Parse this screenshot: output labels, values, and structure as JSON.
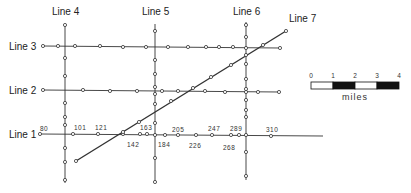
{
  "diagram": {
    "colors": {
      "line": "#333333",
      "point_fill": "#ffffff",
      "point_stroke": "#333333",
      "text": "#222222"
    },
    "lines": [
      {
        "id": "line-1",
        "label": "Line 1",
        "label_pos": [
          9,
          138
        ],
        "from": [
          40,
          134
        ],
        "to": [
          323,
          136
        ],
        "points": [
          [
            40,
            134
          ],
          [
            73,
            134
          ],
          [
            98,
            134
          ],
          [
            123,
            134
          ],
          [
            140,
            134
          ],
          [
            147,
            134
          ],
          [
            155,
            135
          ],
          [
            165,
            135
          ],
          [
            178,
            135
          ],
          [
            196,
            135
          ],
          [
            212,
            135
          ],
          [
            231,
            135
          ],
          [
            239,
            135
          ],
          [
            246,
            135
          ],
          [
            271,
            136
          ]
        ]
      },
      {
        "id": "line-2",
        "label": "Line 2",
        "label_pos": [
          9,
          94
        ],
        "from": [
          43,
          90
        ],
        "to": [
          280,
          92
        ],
        "points": [
          [
            43,
            90
          ],
          [
            83,
            90
          ],
          [
            110,
            91
          ],
          [
            137,
            91
          ],
          [
            162,
            91
          ],
          [
            178,
            91
          ],
          [
            205,
            91
          ],
          [
            225,
            92
          ],
          [
            246,
            92
          ],
          [
            258,
            92
          ],
          [
            279,
            92
          ]
        ]
      },
      {
        "id": "line-3",
        "label": "Line 3",
        "label_pos": [
          9,
          50
        ],
        "from": [
          43,
          46
        ],
        "to": [
          280,
          48
        ],
        "points": [
          [
            43,
            46
          ],
          [
            58,
            46
          ],
          [
            75,
            46
          ],
          [
            100,
            46
          ],
          [
            123,
            47
          ],
          [
            146,
            47
          ],
          [
            168,
            47
          ],
          [
            188,
            47
          ],
          [
            206,
            47
          ],
          [
            219,
            47
          ],
          [
            233,
            47
          ],
          [
            246,
            48
          ],
          [
            280,
            48
          ]
        ]
      },
      {
        "id": "line-4",
        "label": "Line 4",
        "label_pos": [
          52,
          15
        ],
        "from": [
          65,
          25
        ],
        "to": [
          65,
          183
        ],
        "points": [
          [
            65,
            25
          ],
          [
            65,
            58
          ],
          [
            65,
            76
          ],
          [
            65,
            103
          ],
          [
            65,
            117
          ],
          [
            65,
            125
          ],
          [
            65,
            148
          ],
          [
            65,
            162
          ],
          [
            65,
            180
          ]
        ]
      },
      {
        "id": "line-5",
        "label": "Line 5",
        "label_pos": [
          142,
          15
        ],
        "from": [
          155,
          24
        ],
        "to": [
          155,
          183
        ],
        "points": [
          [
            155,
            31
          ],
          [
            155,
            60
          ],
          [
            155,
            74
          ],
          [
            155,
            87
          ],
          [
            155,
            94
          ],
          [
            155,
            104
          ],
          [
            155,
            123
          ],
          [
            155,
            158
          ],
          [
            155,
            182
          ]
        ]
      },
      {
        "id": "line-6",
        "label": "Line 6",
        "label_pos": [
          233,
          15
        ],
        "from": [
          246,
          22
        ],
        "to": [
          246,
          180
        ],
        "points": [
          [
            246,
            25
          ],
          [
            246,
            37
          ],
          [
            246,
            55
          ],
          [
            246,
            64
          ],
          [
            246,
            79
          ],
          [
            246,
            89
          ],
          [
            246,
            100
          ],
          [
            246,
            110
          ],
          [
            246,
            117
          ],
          [
            246,
            152
          ],
          [
            246,
            176
          ]
        ]
      },
      {
        "id": "line-7",
        "label": "Line 7",
        "label_pos": [
          289,
          22
        ],
        "from": [
          76,
          161
        ],
        "to": [
          286,
          31
        ],
        "points": [
          [
            76,
            161
          ],
          [
            123,
            132
          ],
          [
            139,
            122
          ],
          [
            171,
            101
          ],
          [
            193,
            88
          ],
          [
            211,
            77
          ],
          [
            231,
            65
          ],
          [
            263,
            45
          ],
          [
            286,
            31
          ]
        ]
      }
    ],
    "point_labels": [
      {
        "text": "80",
        "pos": [
          40,
          131
        ]
      },
      {
        "text": "101",
        "pos": [
          74,
          130
        ]
      },
      {
        "text": "121",
        "pos": [
          95,
          130
        ]
      },
      {
        "text": "142",
        "pos": [
          127,
          147
        ]
      },
      {
        "text": "163",
        "pos": [
          140,
          130
        ]
      },
      {
        "text": "184",
        "pos": [
          158,
          147
        ]
      },
      {
        "text": "205",
        "pos": [
          172,
          132
        ]
      },
      {
        "text": "226",
        "pos": [
          189,
          148
        ]
      },
      {
        "text": "247",
        "pos": [
          208,
          131
        ]
      },
      {
        "text": "268",
        "pos": [
          223,
          150
        ]
      },
      {
        "text": "289",
        "pos": [
          230,
          131
        ]
      },
      {
        "text": "310",
        "pos": [
          266,
          132
        ]
      }
    ],
    "scale_bar": {
      "x": 311,
      "y": 82,
      "segment_width": 22,
      "height": 7,
      "ticks": [
        "0",
        "1",
        "2",
        "3",
        "4"
      ],
      "segments": [
        "white",
        "black",
        "white",
        "black"
      ],
      "unit": "miles"
    }
  }
}
